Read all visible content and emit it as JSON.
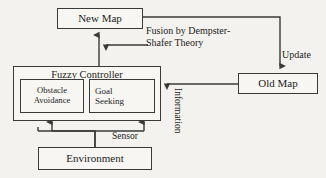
{
  "diagram": {
    "background_color": "#f3f2ee",
    "line_color": "#3a3a38",
    "nodes": {
      "new_map": "New Map",
      "old_map": "Old Map",
      "fuzzy_controller": "Fuzzy Controller",
      "obstacle_avoidance_line1": "Obstacle",
      "obstacle_avoidance_line2": "Avoidance",
      "goal_seeking_line1": "Goal",
      "goal_seeking_line2": "Seeking",
      "environment": "Environment"
    },
    "edge_labels": {
      "fusion_line1": "Fusion  by  Dempster-",
      "fusion_line2": "Shafer Theory",
      "update": "Update",
      "sensor": "Sensor",
      "information": "Information"
    },
    "edges": [
      {
        "from": "new_map",
        "to": "old_map",
        "label": "Update",
        "arrow": "down"
      },
      {
        "from": "old_map",
        "to": "fuzzy_controller",
        "label": "Information",
        "arrow": "left"
      },
      {
        "from": "fuzzy_controller",
        "to": "new_map",
        "label": "",
        "arrow": "up"
      },
      {
        "from": "old_map_branch",
        "to": "new_map_riser",
        "label": "Fusion by Dempster-Shafer Theory",
        "arrow": "left"
      },
      {
        "from": "environment",
        "to": "obstacle_avoidance",
        "label": "Sensor",
        "arrow": "up"
      },
      {
        "from": "environment",
        "to": "goal_seeking",
        "label": "Sensor",
        "arrow": "up"
      }
    ]
  }
}
